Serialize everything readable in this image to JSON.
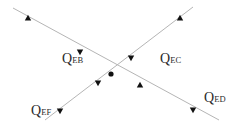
{
  "diagram": {
    "type": "node-flow",
    "line_color": "#b5b5b5",
    "arrow_color": "#111111",
    "node": {
      "id": "E",
      "x": 111,
      "y": 74
    },
    "lines": [
      {
        "name": "line-eb-ed",
        "x1": 13,
        "y1": 8,
        "x2": 219,
        "y2": 120
      },
      {
        "name": "line-ec-ef",
        "x1": 193,
        "y1": 7,
        "x2": 45,
        "y2": 120
      }
    ],
    "arrows": [
      {
        "name": "arrow-eb-outer",
        "x": 28,
        "y": 18,
        "dir": "up"
      },
      {
        "name": "arrow-eb-inner",
        "x": 80,
        "y": 52,
        "dir": "down"
      },
      {
        "name": "arrow-ec-outer",
        "x": 180,
        "y": 18,
        "dir": "up"
      },
      {
        "name": "arrow-ec-inner",
        "x": 131,
        "y": 58,
        "dir": "down"
      },
      {
        "name": "arrow-ef-inner",
        "x": 98,
        "y": 83,
        "dir": "down"
      },
      {
        "name": "arrow-ef-outer",
        "x": 60,
        "y": 111,
        "dir": "down"
      },
      {
        "name": "arrow-ed-inner",
        "x": 140,
        "y": 85,
        "dir": "up"
      },
      {
        "name": "arrow-ed-outer",
        "x": 193,
        "y": 110,
        "dir": "down"
      }
    ],
    "labels": [
      {
        "name": "label-qeb",
        "main": "Q",
        "sub": "EB",
        "x": 62,
        "y": 52
      },
      {
        "name": "label-qec",
        "main": "Q",
        "sub": "EC",
        "x": 160,
        "y": 52
      },
      {
        "name": "label-qef",
        "main": "Q",
        "sub": "EF",
        "x": 31,
        "y": 104
      },
      {
        "name": "label-qed",
        "main": "Q",
        "sub": "ED",
        "x": 204,
        "y": 91
      }
    ]
  }
}
